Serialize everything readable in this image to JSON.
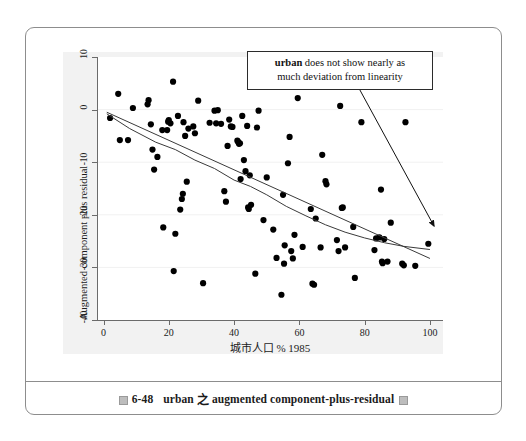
{
  "figure": {
    "caption_marker": "caption-box-glyph",
    "caption_number": "6-48",
    "caption_subject": "urban",
    "caption_zhi": "之",
    "caption_text": "augmented component-plus-residual",
    "caption_tail_glyph": "caption-box-glyph"
  },
  "annotation": {
    "bold_term": "urban",
    "rest_line1": " does not show nearly as",
    "line2": "much deviation from linearity",
    "full_text": "urban does not show nearly as much deviation from linearity",
    "arrow_name": "annotation-arrow"
  },
  "chart_data": {
    "type": "scatter",
    "title": "",
    "xlabel": "城市人口 % 1985",
    "ylabel": "Augmented component plus residual",
    "xlim": [
      -2,
      104
    ],
    "ylim": [
      -40,
      10
    ],
    "xticks": [
      0,
      20,
      40,
      60,
      80,
      100
    ],
    "yticks": [
      10,
      0,
      -10,
      -20,
      -30,
      -40
    ],
    "xtick_labels": [
      "0",
      "20",
      "40",
      "60",
      "80",
      "100"
    ],
    "ytick_labels": [
      "10",
      "0",
      "-10",
      "-20",
      "-30",
      "-40"
    ],
    "grid": true,
    "grid_axis": "y",
    "legend": "none",
    "marker_color": "#000000",
    "marker_size": 3.1,
    "line_color": "#3a3a3a",
    "points": [
      [
        2.0,
        -1.6
      ],
      [
        4.5,
        3.0
      ],
      [
        5.0,
        -5.8
      ],
      [
        7.5,
        -5.8
      ],
      [
        9.0,
        0.3
      ],
      [
        13.5,
        1.0
      ],
      [
        13.8,
        1.8
      ],
      [
        14.5,
        -2.8
      ],
      [
        15.0,
        -7.6
      ],
      [
        15.5,
        -11.4
      ],
      [
        16.5,
        -9.0
      ],
      [
        18.0,
        -3.9
      ],
      [
        18.3,
        -22.4
      ],
      [
        19.5,
        -3.9
      ],
      [
        19.8,
        -2.3
      ],
      [
        20.0,
        -2.0
      ],
      [
        20.5,
        -2.6
      ],
      [
        21.3,
        5.3
      ],
      [
        21.5,
        -30.7
      ],
      [
        22.0,
        -23.6
      ],
      [
        22.8,
        -1.2
      ],
      [
        23.5,
        -19.0
      ],
      [
        24.0,
        -17.0
      ],
      [
        24.3,
        -16.0
      ],
      [
        24.5,
        -2.4
      ],
      [
        25.0,
        -5.0
      ],
      [
        25.5,
        -13.7
      ],
      [
        26.0,
        -3.6
      ],
      [
        27.5,
        -3.2
      ],
      [
        28.0,
        -4.5
      ],
      [
        29.0,
        1.7
      ],
      [
        30.5,
        -33.0
      ],
      [
        32.5,
        -2.5
      ],
      [
        34.0,
        -0.2
      ],
      [
        34.5,
        -2.6
      ],
      [
        35.0,
        -0.1
      ],
      [
        36.0,
        -2.7
      ],
      [
        37.0,
        -15.5
      ],
      [
        37.5,
        -17.5
      ],
      [
        38.0,
        -6.9
      ],
      [
        38.5,
        -1.9
      ],
      [
        39.0,
        -3.2
      ],
      [
        39.5,
        -3.3
      ],
      [
        41.0,
        -5.9
      ],
      [
        41.3,
        -6.2
      ],
      [
        41.5,
        -6.5
      ],
      [
        41.8,
        -6.4
      ],
      [
        42.0,
        -13.2
      ],
      [
        42.5,
        -1.2
      ],
      [
        43.0,
        -9.6
      ],
      [
        43.5,
        -11.7
      ],
      [
        44.0,
        -3.1
      ],
      [
        44.3,
        -18.6
      ],
      [
        44.5,
        -18.9
      ],
      [
        44.8,
        -12.5
      ],
      [
        45.2,
        -18.1
      ],
      [
        46.5,
        -31.2
      ],
      [
        47.0,
        -3.4
      ],
      [
        47.5,
        -0.2
      ],
      [
        49.0,
        -21.0
      ],
      [
        50.0,
        -12.9
      ],
      [
        52.0,
        -22.8
      ],
      [
        53.0,
        -28.2
      ],
      [
        54.5,
        -35.2
      ],
      [
        55.0,
        -16.2
      ],
      [
        55.3,
        -29.3
      ],
      [
        55.5,
        -25.8
      ],
      [
        56.5,
        -10.2
      ],
      [
        57.0,
        -5.2
      ],
      [
        57.5,
        -26.9
      ],
      [
        58.0,
        -28.3
      ],
      [
        58.5,
        -23.8
      ],
      [
        59.5,
        2.2
      ],
      [
        61.0,
        -26.1
      ],
      [
        63.5,
        -18.9
      ],
      [
        64.0,
        -33.1
      ],
      [
        64.5,
        -33.3
      ],
      [
        65.0,
        -20.7
      ],
      [
        66.5,
        -26.2
      ],
      [
        67.0,
        -8.6
      ],
      [
        68.0,
        -13.6
      ],
      [
        68.3,
        -14.2
      ],
      [
        71.5,
        -24.8
      ],
      [
        72.0,
        -26.9
      ],
      [
        72.5,
        0.7
      ],
      [
        73.0,
        -18.7
      ],
      [
        73.3,
        -18.6
      ],
      [
        74.0,
        -26.2
      ],
      [
        76.5,
        -22.3
      ],
      [
        77.0,
        -32.0
      ],
      [
        79.0,
        -2.4
      ],
      [
        83.0,
        -26.7
      ],
      [
        83.5,
        -24.5
      ],
      [
        84.5,
        -24.3
      ],
      [
        85.0,
        -15.2
      ],
      [
        85.3,
        -28.9
      ],
      [
        85.5,
        -29.2
      ],
      [
        86.0,
        -24.6
      ],
      [
        87.0,
        -28.9
      ],
      [
        88.0,
        -21.5
      ],
      [
        91.5,
        -29.3
      ],
      [
        92.0,
        -29.6
      ],
      [
        92.5,
        -2.4
      ],
      [
        95.5,
        -29.7
      ],
      [
        99.5,
        -25.5
      ]
    ],
    "fit_line": {
      "name": "linear-fit",
      "points": [
        [
          1.0,
          -0.5
        ],
        [
          100.0,
          -28.3
        ]
      ]
    },
    "lowess_line": {
      "name": "lowess-curve",
      "points": [
        [
          1.0,
          -0.8
        ],
        [
          8.0,
          -3.6
        ],
        [
          16.0,
          -6.2
        ],
        [
          22.0,
          -7.6
        ],
        [
          28.0,
          -9.6
        ],
        [
          34.0,
          -11.2
        ],
        [
          40.0,
          -13.4
        ],
        [
          45.0,
          -14.6
        ],
        [
          50.0,
          -16.2
        ],
        [
          56.0,
          -18.4
        ],
        [
          62.0,
          -20.2
        ],
        [
          68.0,
          -21.9
        ],
        [
          74.0,
          -23.3
        ],
        [
          80.0,
          -24.4
        ],
        [
          86.0,
          -25.3
        ],
        [
          92.0,
          -26.0
        ],
        [
          100.0,
          -26.6
        ]
      ]
    }
  }
}
